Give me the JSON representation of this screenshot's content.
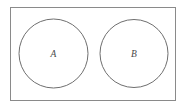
{
  "diagram": {
    "type": "venn-disjoint",
    "background_color": "#ffffff",
    "universe": {
      "name": "universal-set-rectangle",
      "x": 10,
      "y": 7,
      "width": 166,
      "height": 94,
      "stroke_color": "#8a8a8a",
      "stroke_width": 1,
      "fill_color": "#ffffff",
      "label": ""
    },
    "sets": [
      {
        "id": "A",
        "label": "A",
        "cx": 53.5,
        "cy": 53.5,
        "r": 34.5,
        "stroke_color": "#6f6f6f",
        "stroke_width": 1,
        "fill_color": "none",
        "label_x": 53.5,
        "label_y": 57
      },
      {
        "id": "B",
        "label": "B",
        "cx": 134,
        "cy": 53.5,
        "r": 34,
        "stroke_color": "#6f6f6f",
        "stroke_width": 1,
        "fill_color": "none",
        "label_x": 134,
        "label_y": 57
      }
    ],
    "relationship": "disjoint",
    "intersection_label": ""
  }
}
